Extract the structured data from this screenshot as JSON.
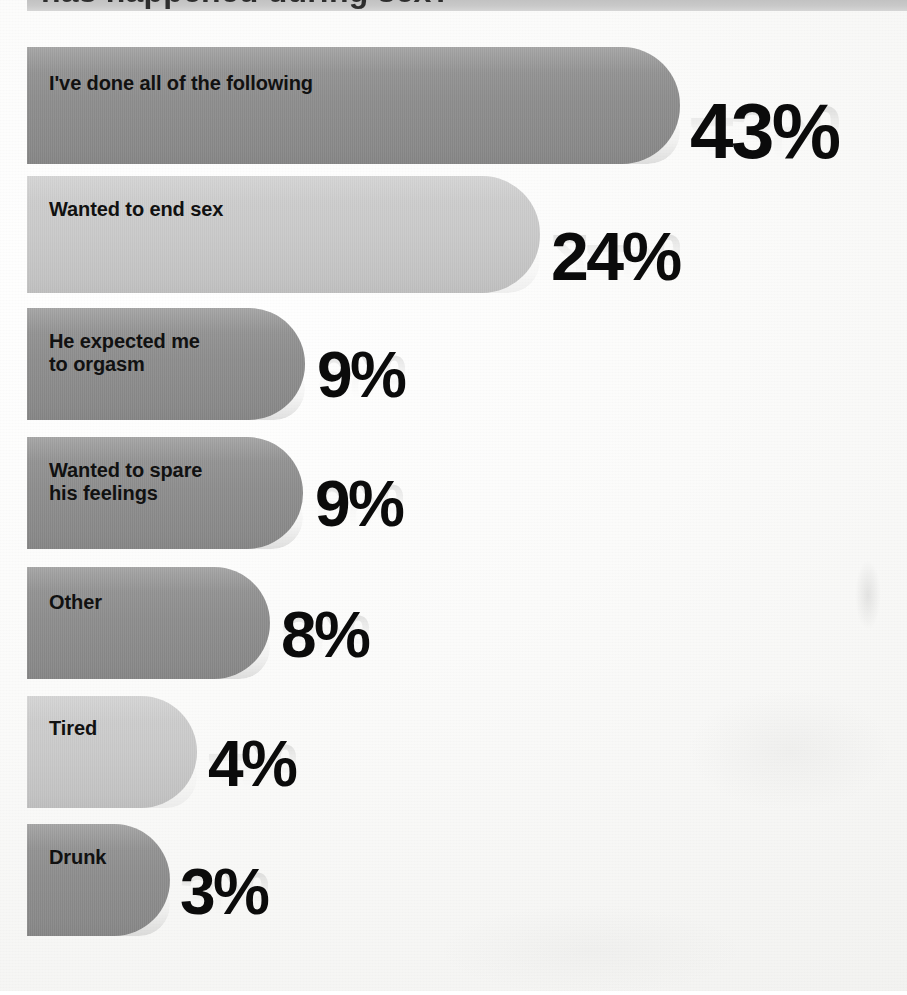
{
  "title_strip": {
    "clipped_headline": "has happened during sex?"
  },
  "colors": {
    "bar_dark": "#8c8c8c",
    "bar_light": "#c9c9c9",
    "label_text": "#111111",
    "value_text": "#0b0b0b",
    "page_background": "#fbfbfa",
    "title_strip": "#c9c9c9"
  },
  "chart_data": {
    "type": "bar",
    "orientation": "horizontal",
    "title": "",
    "xlabel": "",
    "ylabel": "",
    "grid": false,
    "legend": false,
    "value_suffix": "%",
    "xlim": [
      0,
      50
    ],
    "categories": [
      "I've done all of the following",
      "Wanted to end sex",
      "He expected me\nto orgasm",
      "Wanted to spare\nhis feelings",
      "Other",
      "Tired",
      "Drunk"
    ],
    "values": [
      43,
      24,
      9,
      9,
      8,
      4,
      3
    ],
    "value_labels": [
      "43%",
      "24%",
      "9%",
      "9%",
      "8%",
      "4%",
      "3%"
    ],
    "bar_shades": [
      "dark",
      "light",
      "dark",
      "dark",
      "dark",
      "light",
      "dark"
    ]
  },
  "bars": [
    {
      "label": "I've done all of the following",
      "value": 43,
      "value_label": "43%",
      "shade": "dark",
      "geom": {
        "top": 47,
        "height": 117,
        "width": 653,
        "radius": 58
      },
      "label_geom": {
        "top": 25,
        "font_size": 20
      },
      "value_geom": {
        "left": 690,
        "top": 92,
        "font_size": 78
      }
    },
    {
      "label": "Wanted to end sex",
      "value": 24,
      "value_label": "24%",
      "shade": "light",
      "geom": {
        "top": 176,
        "height": 117,
        "width": 513,
        "radius": 58
      },
      "label_geom": {
        "top": 22,
        "font_size": 20
      },
      "value_geom": {
        "left": 551,
        "top": 222,
        "font_size": 68
      }
    },
    {
      "label": "He expected me\nto orgasm",
      "value": 9,
      "value_label": "9%",
      "shade": "dark",
      "geom": {
        "top": 308,
        "height": 112,
        "width": 278,
        "radius": 56
      },
      "label_geom": {
        "top": 22,
        "font_size": 20
      },
      "value_geom": {
        "left": 317,
        "top": 343,
        "font_size": 64
      }
    },
    {
      "label": "Wanted to spare\nhis feelings",
      "value": 9,
      "value_label": "9%",
      "shade": "dark",
      "geom": {
        "top": 437,
        "height": 112,
        "width": 276,
        "radius": 56
      },
      "label_geom": {
        "top": 22,
        "font_size": 20
      },
      "value_geom": {
        "left": 315,
        "top": 472,
        "font_size": 64
      }
    },
    {
      "label": "Other",
      "value": 8,
      "value_label": "8%",
      "shade": "dark",
      "geom": {
        "top": 567,
        "height": 112,
        "width": 243,
        "radius": 56
      },
      "label_geom": {
        "top": 24,
        "font_size": 20
      },
      "value_geom": {
        "left": 281,
        "top": 603,
        "font_size": 64
      }
    },
    {
      "label": "Tired",
      "value": 4,
      "value_label": "4%",
      "shade": "light",
      "geom": {
        "top": 696,
        "height": 112,
        "width": 170,
        "radius": 56
      },
      "label_geom": {
        "top": 21,
        "font_size": 20
      },
      "value_geom": {
        "left": 208,
        "top": 732,
        "font_size": 64
      }
    },
    {
      "label": "Drunk",
      "value": 3,
      "value_label": "3%",
      "shade": "dark",
      "geom": {
        "top": 824,
        "height": 112,
        "width": 143,
        "radius": 56
      },
      "label_geom": {
        "top": 22,
        "font_size": 20
      },
      "value_geom": {
        "left": 180,
        "top": 860,
        "font_size": 64
      }
    }
  ]
}
